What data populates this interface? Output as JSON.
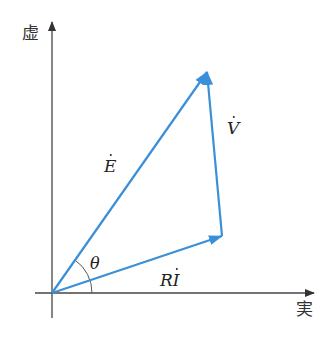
{
  "diagram": {
    "type": "phasor-diagram",
    "axes": {
      "imaginary_label": "虚",
      "real_label": "実"
    },
    "vectors": [
      {
        "name": "E",
        "label": "E",
        "dotted": true,
        "from": [
          52,
          293
        ],
        "to": [
          207,
          72
        ]
      },
      {
        "name": "RI",
        "label_prefix": "R",
        "label": "I",
        "dotted": true,
        "from": [
          52,
          293
        ],
        "to": [
          222,
          236
        ]
      },
      {
        "name": "V",
        "label": "V",
        "dotted": true,
        "from": [
          222,
          236
        ],
        "to": [
          207,
          72
        ]
      }
    ],
    "angle": {
      "label": "θ",
      "between": [
        "E",
        "RI"
      ]
    },
    "colors": {
      "vector": "#3a8fd8",
      "axis": "#333333"
    }
  }
}
